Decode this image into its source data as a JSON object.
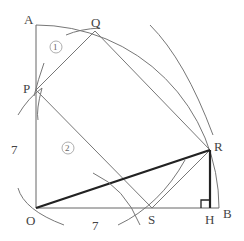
{
  "diagram": {
    "title": "",
    "points": {
      "A": {
        "label": "A",
        "x": 36,
        "y": 22
      },
      "O": {
        "label": "O",
        "x": 36,
        "y": 208
      },
      "B": {
        "label": "B",
        "x": 219,
        "y": 208
      },
      "P": {
        "label": "P",
        "x": 36,
        "y": 90
      },
      "Q": {
        "label": "Q",
        "x": 95,
        "y": 31
      },
      "R": {
        "label": "R",
        "x": 210,
        "y": 150
      },
      "S": {
        "label": "S",
        "x": 152,
        "y": 208
      },
      "H": {
        "label": "H",
        "x": 210,
        "y": 208
      }
    },
    "length_labels": {
      "OP": "7",
      "OS": "7"
    },
    "region_labels": {
      "region1": "①",
      "region2": "②"
    },
    "colors": {
      "thin_line": "#777777",
      "thick_line": "#222222",
      "text": "#444444"
    }
  }
}
